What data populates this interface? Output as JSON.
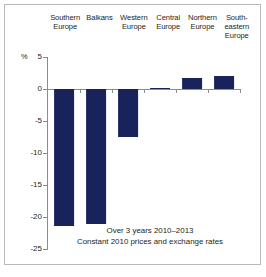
{
  "chart_data": {
    "type": "bar",
    "title": "",
    "subtitle": "",
    "xlabel": "",
    "ylabel": "%",
    "ylim": [
      -25,
      5
    ],
    "yticks": [
      5,
      0,
      -5,
      -10,
      -15,
      -20,
      -25
    ],
    "ytick_labels": [
      "5",
      "0",
      "-5",
      "-10",
      "-15",
      "-20",
      "-25"
    ],
    "grid": false,
    "legend": "none",
    "bar_color": "#18235c",
    "axis_color": "#8c8c8c",
    "categories": [
      "Southern\nEurope",
      "Balkans",
      "Western\nEurope",
      "Central\nEurope",
      "Northern\nEurope",
      "South-\neastern\nEurope"
    ],
    "values": [
      -21.4,
      -21.1,
      -7.5,
      0.2,
      1.7,
      2.1
    ],
    "annotations": [
      "Over 3 years 2010–2013",
      "Constant 2010 prices and exchange rates"
    ]
  },
  "axis": {
    "unit_symbol": "%"
  },
  "caption": {
    "line1": "Over 3 years 2010–2013",
    "line2": "Constant 2010 prices and exchange rates"
  }
}
